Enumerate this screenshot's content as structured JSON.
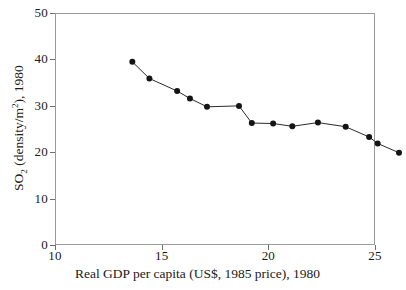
{
  "chart_data": {
    "type": "line",
    "title": "",
    "subtitle": "",
    "xlabel": "Real GDP per capita (US$, 1985 price), 1980",
    "ylabel": "SO2 (density/m2), 1980",
    "ylabel_parts": {
      "prefix": "SO",
      "sub": "2",
      "middle": " (density/m",
      "sup": "2",
      "suffix": "), 1980"
    },
    "xlim": [
      10,
      25
    ],
    "ylim": [
      0,
      50
    ],
    "xticks": [
      10,
      15,
      20,
      25
    ],
    "yticks": [
      0,
      10,
      20,
      30,
      40,
      50
    ],
    "xtick_labels": [
      "10",
      "15",
      "20",
      "25"
    ],
    "ytick_labels": [
      "0",
      "10",
      "20",
      "30",
      "40",
      "50"
    ],
    "grid": false,
    "legend": "none",
    "marker": "filled-circle",
    "line_color": "#2b2b2b",
    "marker_color": "#141414",
    "frame_color": "#9a9a9a",
    "background": "#ffffff",
    "series": [
      {
        "name": "SO2 density vs Real GDP per capita",
        "x": [
          11.0,
          11.8,
          13.1,
          13.7,
          14.5,
          16.0,
          16.6,
          17.6,
          18.5,
          19.7,
          21.0,
          22.1,
          22.5,
          23.5
        ],
        "y": [
          42.5,
          38.9,
          36.2,
          34.6,
          32.8,
          33.0,
          29.3,
          29.2,
          28.6,
          29.4,
          28.5,
          26.3,
          24.9,
          22.9
        ]
      }
    ]
  },
  "axis": {
    "x_title": "Real GDP per capita (US$, 1985 price), 1980"
  }
}
